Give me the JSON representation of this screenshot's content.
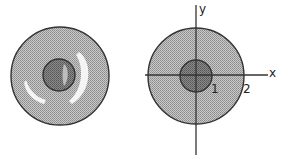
{
  "figures": [
    {
      "name": "cross-section-left",
      "outer_ring_fill": "#b4b4b4",
      "inner_core_fill": "#7a7a7a",
      "highlight_fill": "#f2f2f2",
      "stroke": "#333333"
    },
    {
      "name": "cross-section-right",
      "outer_ring_fill": "#b4b4b4",
      "inner_core_fill": "#7a7a7a",
      "stroke": "#333333",
      "axes": {
        "x_label": "x",
        "y_label": "y"
      },
      "radius_labels": {
        "inner": "1",
        "outer": "2"
      }
    }
  ]
}
